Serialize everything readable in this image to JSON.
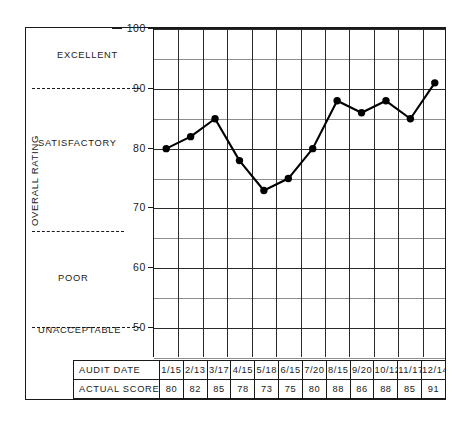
{
  "chart_data": {
    "type": "line",
    "title": "",
    "xlabel": "",
    "ylabel": "OVERALL RATING",
    "ylim": [
      45,
      100
    ],
    "yticks": [
      100,
      90,
      80,
      70,
      60,
      50
    ],
    "ytick_labels": [
      "100",
      "90",
      "80",
      "70",
      "60",
      "50"
    ],
    "minor_ytick_step": 5,
    "grid": true,
    "legend": "none",
    "categories": [
      "1/15",
      "2/13",
      "3/17",
      "4/15",
      "5/18",
      "6/15",
      "7/20",
      "8/15",
      "9/20",
      "10/12",
      "11/17",
      "12/14"
    ],
    "values": [
      80,
      82,
      85,
      78,
      73,
      75,
      80,
      88,
      86,
      88,
      85,
      91
    ],
    "series": [
      {
        "name": "ACTUAL SCORE",
        "values": [
          80,
          82,
          85,
          78,
          73,
          75,
          80,
          88,
          86,
          88,
          85,
          91
        ],
        "marker": "filled-circle",
        "color": "#000000"
      }
    ],
    "bands": [
      {
        "label": "EXCELLENT",
        "min": 90,
        "max": 100
      },
      {
        "label": "SATISFACTORY",
        "min": 66,
        "max": 90
      },
      {
        "label": "POOR",
        "min": 50,
        "max": 66
      },
      {
        "label": "UNACCEPTABLE",
        "min": 45,
        "max": 50
      }
    ],
    "band_dividers": [
      90,
      66,
      50
    ]
  },
  "axis": {
    "title": "OVERALL RATING",
    "ticks": [
      {
        "value": 100,
        "label": "100"
      },
      {
        "value": 90,
        "label": "90"
      },
      {
        "value": 80,
        "label": "80"
      },
      {
        "value": 70,
        "label": "70"
      },
      {
        "value": 60,
        "label": "60"
      },
      {
        "value": 50,
        "label": "50"
      }
    ]
  },
  "bands": {
    "excellent": "EXCELLENT",
    "satisfactory": "SATISFACTORY",
    "poor": "POOR",
    "unacceptable": "UNACCEPTABLE"
  },
  "table": {
    "rows": [
      {
        "header": "AUDIT DATE",
        "cells": [
          "1/15",
          "2/13",
          "3/17",
          "4/15",
          "5/18",
          "6/15",
          "7/20",
          "8/15",
          "9/20",
          "10/12",
          "11/17",
          "12/14"
        ]
      },
      {
        "header": "ACTUAL SCORE",
        "cells": [
          "80",
          "82",
          "85",
          "78",
          "73",
          "75",
          "80",
          "88",
          "86",
          "88",
          "85",
          "91"
        ]
      }
    ]
  },
  "colors": {
    "ink": "#1a1a1a",
    "series": "#000000",
    "grid_major": "#2a2a2a",
    "grid_minor": "#8d8d8d",
    "background": "#ffffff"
  }
}
